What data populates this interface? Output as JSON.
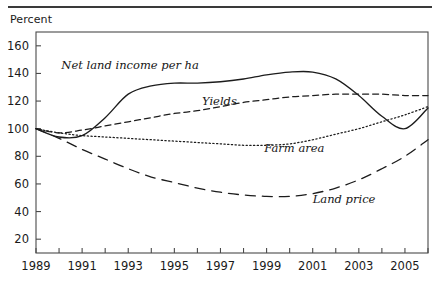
{
  "figure": {
    "axis_title": "Percent",
    "top_rule_color": "#3a3a3a"
  },
  "chart_data": {
    "type": "line",
    "title": "",
    "subtitle": "",
    "xlabel": "",
    "ylabel": "Percent",
    "grid": false,
    "legend_position": "inline-annotations",
    "xlim": [
      1989,
      2006
    ],
    "ylim": [
      10,
      170
    ],
    "y_ticks": [
      20,
      40,
      60,
      80,
      100,
      120,
      140,
      160
    ],
    "y_tick_labels": [
      "20",
      "40",
      "60",
      "80",
      "100",
      "120",
      "140",
      "160"
    ],
    "x_ticks": [
      1989,
      1990,
      1991,
      1992,
      1993,
      1994,
      1995,
      1996,
      1997,
      1998,
      1999,
      2000,
      2001,
      2002,
      2003,
      2004,
      2005,
      2006
    ],
    "x_tick_labels": [
      "1989",
      "",
      "1991",
      "",
      "1993",
      "",
      "1995",
      "",
      "1997",
      "",
      "1999",
      "",
      "2001",
      "",
      "2003",
      "",
      "2005",
      ""
    ],
    "x": [
      1989,
      1990,
      1991,
      1992,
      1993,
      1994,
      1995,
      1996,
      1997,
      1998,
      1999,
      2000,
      2001,
      2002,
      2003,
      2004,
      2005,
      2006
    ],
    "series": [
      {
        "name": "Net land income per ha",
        "style": "solid",
        "label": "Net land income per ha",
        "values": [
          100,
          94,
          95,
          108,
          125,
          131,
          133,
          133,
          134,
          136,
          139,
          141,
          141,
          136,
          124,
          109,
          100,
          115
        ]
      },
      {
        "name": "Yields",
        "style": "dashed",
        "label": "Yields",
        "values": [
          100,
          97,
          99,
          102,
          105,
          108,
          111,
          113,
          116,
          119,
          121,
          123,
          124,
          125,
          125,
          125,
          124,
          124
        ]
      },
      {
        "name": "Farm area",
        "style": "dotted",
        "label": "Farm area",
        "values": [
          100,
          97,
          95,
          94,
          93,
          92,
          91,
          90,
          89,
          88,
          88,
          89,
          92,
          96,
          100,
          105,
          110,
          116
        ]
      },
      {
        "name": "Land price",
        "style": "longdash",
        "label": "Land price",
        "values": [
          100,
          93,
          85,
          78,
          71,
          65,
          61,
          57,
          54,
          52,
          51,
          51,
          53,
          57,
          63,
          71,
          80,
          92
        ]
      }
    ],
    "annotations": [
      {
        "text": "Net land income per ha",
        "x": 1990.1,
        "y": 143
      },
      {
        "text": "Yields",
        "x": 1996.2,
        "y": 117
      },
      {
        "text": "Farm area",
        "x": 1998.9,
        "y": 83
      },
      {
        "text": "Land price",
        "x": 2001.0,
        "y": 46
      }
    ]
  }
}
